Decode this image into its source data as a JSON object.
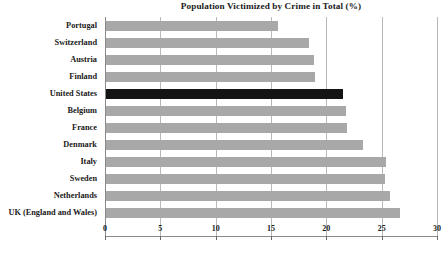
{
  "chart_data": {
    "type": "bar",
    "orientation": "horizontal",
    "title": "Population Victimized by Crime in Total (%)",
    "xlabel": "",
    "ylabel": "",
    "xlim": [
      0,
      30
    ],
    "xticks": [
      0,
      5,
      10,
      15,
      20,
      25,
      30
    ],
    "xtick_labels": [
      "0",
      "5",
      "10",
      "15",
      "20",
      "25",
      "30"
    ],
    "grid": "vertical",
    "legend": "none",
    "categories": [
      "Portugal",
      "Switzerland",
      "Austria",
      "Finland",
      "United States",
      "Belgium",
      "France",
      "Denmark",
      "Italy",
      "Sweden",
      "Netherlands",
      "UK (England and Wales)"
    ],
    "values": [
      15.5,
      18.3,
      18.8,
      18.9,
      21.4,
      21.7,
      21.8,
      23.2,
      25.3,
      25.2,
      25.7,
      26.6
    ],
    "highlight_category": "United States",
    "colors": {
      "bar": "#a8a8a8",
      "bar_highlight": "#141414",
      "grid": "#b8b8b8",
      "axis": "#8a8a8a",
      "text": "#1a1a1a",
      "background": "#ffffff"
    }
  }
}
